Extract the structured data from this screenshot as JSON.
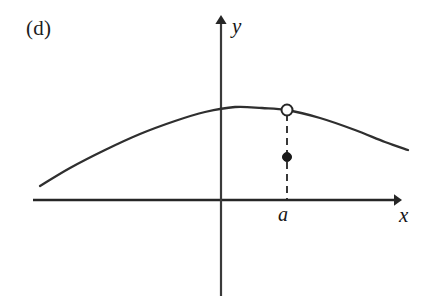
{
  "figure": {
    "panel_label": "(d)",
    "background_color": "#ffffff",
    "ink_color": "#2b2b2b"
  },
  "axes": {
    "x_label": "x",
    "y_label": "y",
    "x_axis": {
      "y_pixel": 200,
      "x_start": 33,
      "x_end": 402,
      "arrow": "right"
    },
    "y_axis": {
      "x_pixel": 221,
      "y_start": 16,
      "y_end": 296,
      "arrow": "up"
    },
    "origin": {
      "x": 221,
      "y": 200
    },
    "color": "#262626"
  },
  "annotations": {
    "a_tick_label": "a"
  },
  "chart_data": {
    "type": "line",
    "title": "(d)",
    "xlabel": "x",
    "ylabel": "y",
    "grid": false,
    "legend": "none",
    "axis_style": "arrow-terminated cartesian axes, unscaled",
    "series": [
      {
        "name": "f(x)",
        "style": "solid-curve",
        "color": "#2f2f2f",
        "line_width": 2.3,
        "shape": "concave-down parabola-like arc",
        "points": [
          {
            "x": 40,
            "y": 186
          },
          {
            "x": 70,
            "y": 168
          },
          {
            "x": 105,
            "y": 150
          },
          {
            "x": 140,
            "y": 134
          },
          {
            "x": 175,
            "y": 121
          },
          {
            "x": 205,
            "y": 112
          },
          {
            "x": 235,
            "y": 107
          },
          {
            "x": 262,
            "y": 108
          },
          {
            "x": 287,
            "y": 110
          },
          {
            "x": 320,
            "y": 118
          },
          {
            "x": 355,
            "y": 130
          },
          {
            "x": 385,
            "y": 142
          },
          {
            "x": 408,
            "y": 150
          }
        ]
      }
    ],
    "markers": [
      {
        "name": "open-circle",
        "kind": "open",
        "meaning": "limit value at x = a, not attained",
        "x": 287,
        "y": 110,
        "radius": 5.5,
        "fill": "#ffffff",
        "stroke": "#262626"
      },
      {
        "name": "filled-dot",
        "kind": "filled",
        "meaning": "actual function value f(a)",
        "x": 287,
        "y": 157,
        "radius": 4.5,
        "fill": "#1a1a1a",
        "stroke": "#1a1a1a"
      }
    ],
    "guide_lines": [
      {
        "name": "dashed-drop-line",
        "orientation": "vertical",
        "x": 287,
        "y_top": 114,
        "y_bottom": 200,
        "dash": "7 5",
        "color": "#242424",
        "width": 1.8
      }
    ],
    "tick_labels": [
      {
        "axis": "x",
        "text": "a",
        "x": 287,
        "y": 200
      }
    ]
  }
}
